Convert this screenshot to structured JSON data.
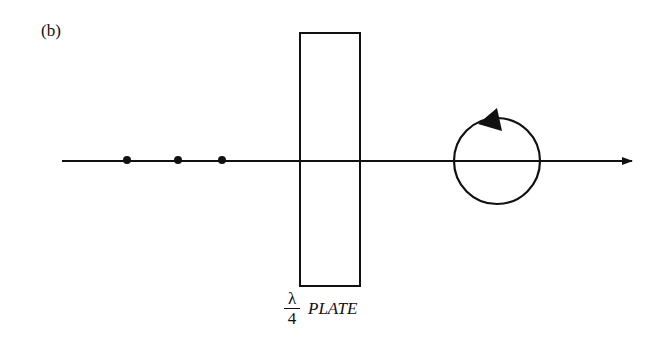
{
  "panel_label": "(b)",
  "plate_label": {
    "numerator": "λ",
    "denominator": "4",
    "text": "PLATE"
  },
  "diagram": {
    "axis": {
      "x1": 62,
      "x2": 632,
      "y": 161
    },
    "dots_x": [
      127,
      178,
      222
    ],
    "plate_rect": {
      "x": 300,
      "y": 33,
      "w": 60,
      "h": 253
    },
    "circle": {
      "cx": 497,
      "cy": 161,
      "r": 43
    },
    "stroke_color": "#111111"
  }
}
